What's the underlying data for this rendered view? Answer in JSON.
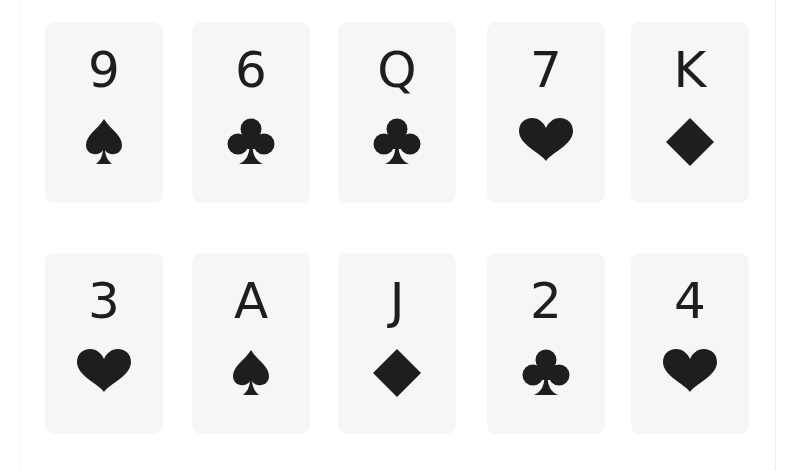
{
  "board": {
    "ink_color": "#1e1e1e",
    "card_color": "#f6f6f6",
    "rows": [
      [
        {
          "rank": "9",
          "suit": "spade"
        },
        {
          "rank": "6",
          "suit": "club"
        },
        {
          "rank": "Q",
          "suit": "club"
        },
        {
          "rank": "7",
          "suit": "heart"
        },
        {
          "rank": "K",
          "suit": "diamond"
        }
      ],
      [
        {
          "rank": "3",
          "suit": "heart"
        },
        {
          "rank": "A",
          "suit": "spade"
        },
        {
          "rank": "J",
          "suit": "diamond"
        },
        {
          "rank": "2",
          "suit": "club"
        },
        {
          "rank": "4",
          "suit": "heart"
        }
      ]
    ]
  }
}
